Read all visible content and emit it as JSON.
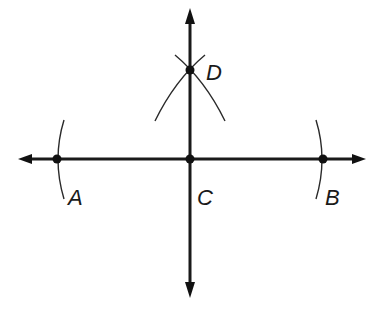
{
  "diagram": {
    "colors": {
      "stroke": "#1a1a1a",
      "background": "#ffffff"
    },
    "lines": [
      {
        "name": "horizontal-line",
        "from": [
          18,
          159
        ],
        "to": [
          366,
          159
        ],
        "arrows": "both"
      },
      {
        "name": "vertical-line",
        "from": [
          190,
          8
        ],
        "to": [
          190,
          298
        ],
        "arrows": "both"
      }
    ],
    "points": [
      {
        "id": "A",
        "label": "A",
        "x": 57,
        "y": 159,
        "label_x": 68,
        "label_y": 205
      },
      {
        "id": "B",
        "label": "B",
        "x": 323,
        "y": 159,
        "label_x": 326,
        "label_y": 205
      },
      {
        "id": "C",
        "label": "C",
        "x": 190,
        "y": 159,
        "label_x": 197,
        "label_y": 205
      },
      {
        "id": "D",
        "label": "D",
        "x": 190,
        "y": 70,
        "label_x": 206,
        "label_y": 80
      }
    ],
    "arcs": [
      {
        "name": "arc-at-A",
        "description": "compass arc through A centered at C"
      },
      {
        "name": "arc-at-B",
        "description": "compass arc through B centered at C"
      },
      {
        "name": "arc-from-A",
        "description": "compass arc near D centered at A"
      },
      {
        "name": "arc-from-B",
        "description": "compass arc near D centered at B"
      }
    ]
  },
  "labels": {
    "A": "A",
    "B": "B",
    "C": "C",
    "D": "D"
  }
}
